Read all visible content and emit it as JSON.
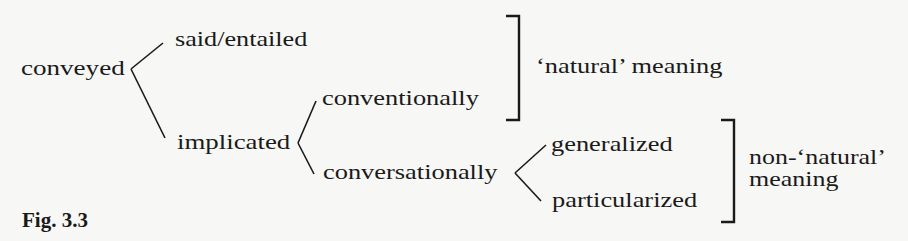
{
  "figure": {
    "caption": "Fig. 3.3",
    "nodes": {
      "root": "conveyed",
      "said": "said/entailed",
      "implicated": "implicated",
      "conventionally": "conventionally",
      "conversationally": "conversationally",
      "generalized": "generalized",
      "particularized": "particularized"
    },
    "brackets": {
      "natural": "‘natural’ meaning",
      "non_natural_line1": "non-‘natural’",
      "non_natural_line2": "meaning"
    },
    "edges": [
      {
        "from": "conveyed",
        "to": "said/entailed"
      },
      {
        "from": "conveyed",
        "to": "implicated"
      },
      {
        "from": "implicated",
        "to": "conventionally"
      },
      {
        "from": "implicated",
        "to": "conversationally"
      },
      {
        "from": "conversationally",
        "to": "generalized"
      },
      {
        "from": "conversationally",
        "to": "particularized"
      }
    ],
    "groupings": [
      {
        "label": "‘natural’ meaning",
        "members": [
          "said/entailed",
          "conventionally"
        ]
      },
      {
        "label": "non-‘natural’ meaning",
        "members": [
          "generalized",
          "particularized"
        ]
      }
    ]
  }
}
